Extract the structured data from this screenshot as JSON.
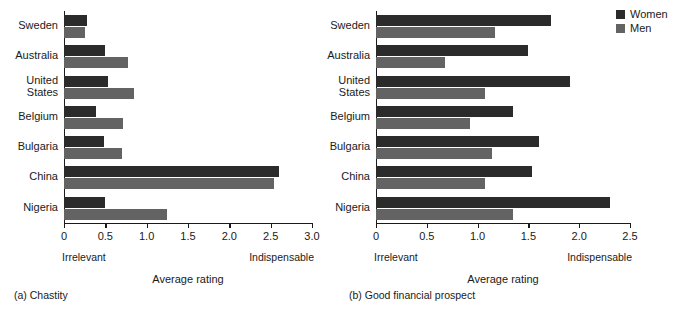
{
  "legend": {
    "entries": [
      {
        "label": "Women",
        "color": "#2b2b2b",
        "key": "women"
      },
      {
        "label": "Men",
        "color": "#636363",
        "key": "men"
      }
    ]
  },
  "panels": [
    {
      "id": "a",
      "caption": "(a) Chastity",
      "axis_title": "Average rating",
      "end_left": "Irrelevant",
      "end_right": "Indispensable"
    },
    {
      "id": "b",
      "caption": "(b) Good financial prospect",
      "axis_title": "Average rating",
      "end_left": "Irrelevant",
      "end_right": "Indispensable"
    }
  ],
  "chart_data": [
    {
      "type": "bar",
      "orientation": "horizontal",
      "title": "(a) Chastity",
      "xlabel": "Average rating",
      "ylabel": "",
      "xlim": [
        0,
        3.0
      ],
      "xticks": [
        0,
        0.5,
        1.0,
        1.5,
        2.0,
        2.5,
        3.0
      ],
      "xticklabels": [
        "0",
        "0.5",
        "1.0",
        "1.5",
        "2.0",
        "2.5",
        "3.0"
      ],
      "x_axis_low_label": "Irrelevant",
      "x_axis_high_label": "Indispensable",
      "grid": false,
      "legend_position": "outside right top",
      "categories": [
        "Sweden",
        "Australia",
        "United\nStates",
        "Belgium",
        "Bulgaria",
        "China",
        "Nigeria"
      ],
      "series": [
        {
          "name": "Women",
          "color": "#2b2b2b",
          "values": [
            0.28,
            0.49,
            0.53,
            0.39,
            0.48,
            2.6,
            0.49
          ]
        },
        {
          "name": "Men",
          "color": "#636363",
          "values": [
            0.25,
            0.78,
            0.85,
            0.71,
            0.7,
            2.54,
            1.24
          ]
        }
      ]
    },
    {
      "type": "bar",
      "orientation": "horizontal",
      "title": "(b) Good financial prospect",
      "xlabel": "Average rating",
      "ylabel": "",
      "xlim": [
        0,
        2.5
      ],
      "xticks": [
        0,
        0.5,
        1.0,
        1.5,
        2.0,
        2.5
      ],
      "xticklabels": [
        "0",
        "0.5",
        "1.0",
        "1.5",
        "2.0",
        "2.5"
      ],
      "x_axis_low_label": "Irrelevant",
      "x_axis_high_label": "Indispensable",
      "grid": false,
      "legend_position": "outside right top",
      "categories": [
        "Sweden",
        "Australia",
        "United\nStates",
        "Belgium",
        "Bulgaria",
        "China",
        "Nigeria"
      ],
      "series": [
        {
          "name": "Women",
          "color": "#2b2b2b",
          "values": [
            1.72,
            1.5,
            1.91,
            1.35,
            1.6,
            1.54,
            2.3
          ]
        },
        {
          "name": "Men",
          "color": "#636363",
          "values": [
            1.17,
            0.68,
            1.07,
            0.93,
            1.14,
            1.07,
            1.35
          ]
        }
      ]
    }
  ]
}
